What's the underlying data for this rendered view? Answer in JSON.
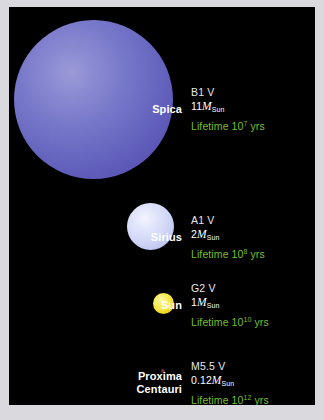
{
  "figure": {
    "background": "#000000",
    "border_color": "#d9d9de",
    "lifetime_color": "#77bf2e",
    "text_color": "#ffffff"
  },
  "chart_data": {
    "type": "diagram",
    "title": "",
    "categories": [
      "Spica",
      "Sirius",
      "Sun",
      "Proxima Centauri"
    ],
    "series": [
      {
        "name": "mass_solar",
        "values": [
          11,
          2,
          1,
          0.12
        ]
      },
      {
        "name": "lifetime_years_exponent",
        "values": [
          7,
          8,
          10,
          12
        ]
      },
      {
        "name": "rendered_diameter_px",
        "values": [
          159,
          47,
          21,
          4
        ]
      }
    ],
    "legend": []
  },
  "stars": [
    {
      "name": "Spica",
      "spectral_class": "B1 V",
      "mass_value": "11",
      "mass_symbol": "M",
      "mass_subscript": "Sun",
      "lifetime_prefix": "Lifetime 10",
      "lifetime_exponent": "7",
      "lifetime_suffix": " yrs",
      "color": "#6565bf"
    },
    {
      "name": "Sirius",
      "spectral_class": "A1 V",
      "mass_value": "2",
      "mass_symbol": "M",
      "mass_subscript": "Sun",
      "lifetime_prefix": "Lifetime 10",
      "lifetime_exponent": "8",
      "lifetime_suffix": " yrs",
      "color": "#d0d6f6"
    },
    {
      "name": "Sun",
      "spectral_class": "G2 V",
      "mass_value": "1",
      "mass_symbol": "M",
      "mass_subscript": "Sun",
      "lifetime_prefix": "Lifetime 10",
      "lifetime_exponent": "10",
      "lifetime_suffix": " yrs",
      "color": "#f4df2c"
    },
    {
      "name_line1": "Proxima",
      "name_line2": "Centauri",
      "name": "Proxima Centauri",
      "spectral_class": "M5.5 V",
      "mass_value": "0.12",
      "mass_symbol": "M",
      "mass_subscript": "Sun",
      "lifetime_prefix": "Lifetime 10",
      "lifetime_exponent": "12",
      "lifetime_suffix": " yrs",
      "color": "#5a2626"
    }
  ]
}
